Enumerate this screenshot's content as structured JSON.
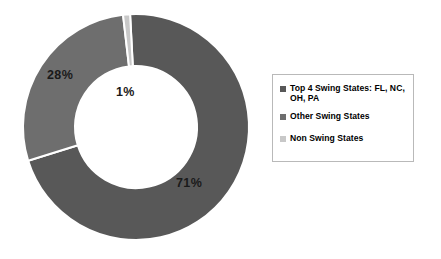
{
  "chart_data": {
    "type": "pie",
    "variant": "donut",
    "title": "",
    "subtitle": "",
    "xlabel": "",
    "ylabel": "",
    "grid": false,
    "legend_position": "right",
    "start_angle_deg": -93,
    "direction": "clockwise",
    "inner_radius_ratio": 0.54,
    "categories": [
      "Top 4 Swing States: FL, NC, OH, PA",
      "Other Swing States",
      "Non Swing States"
    ],
    "values": [
      71,
      28,
      1
    ],
    "value_unit": "%",
    "data_labels": [
      "71%",
      "28%",
      "1%"
    ],
    "colors": [
      "#585858",
      "#6e6e6e",
      "#c8c8c8"
    ]
  },
  "legend": {
    "items": [
      {
        "label": "Top 4 Swing States: FL, NC, OH, PA",
        "color": "#585858"
      },
      {
        "label": "Other Swing States",
        "color": "#6e6e6e"
      },
      {
        "label": "Non Swing States",
        "color": "#c8c8c8"
      }
    ]
  },
  "labels": {
    "top4": "71%",
    "other": "28%",
    "non": "1%"
  }
}
